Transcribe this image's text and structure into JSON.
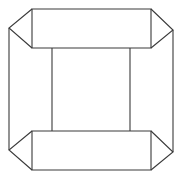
{
  "diagram": {
    "type": "line-drawing",
    "canvas": {
      "width": 181,
      "height": 181,
      "background": "#ffffff"
    },
    "stroke_color": "#3a3a3a",
    "shapes": {
      "top_band": {
        "rect": {
          "x1": 32,
          "y1": 9,
          "x2": 151,
          "y2": 48
        },
        "left_tip": {
          "x": 9,
          "y": 28
        },
        "right_tip": {
          "x": 173,
          "y": 30
        }
      },
      "bottom_band": {
        "rect": {
          "x1": 32,
          "y1": 131,
          "x2": 151,
          "y2": 170
        },
        "left_tip": {
          "x": 9,
          "y": 150
        },
        "right_tip": {
          "x": 173,
          "y": 152
        }
      },
      "inner_square": {
        "x1": 52,
        "y1": 48,
        "x2": 130,
        "y2": 131
      },
      "outer_left_edge": {
        "x": 9,
        "y1": 28,
        "y2": 150
      },
      "outer_right_edge": {
        "x": 173,
        "y1": 30,
        "y2": 152
      }
    }
  }
}
